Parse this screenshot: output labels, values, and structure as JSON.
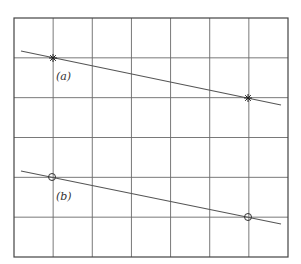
{
  "figure": {
    "grid": {
      "x0": 14,
      "y0": 18,
      "x1": 288,
      "y1": 257,
      "cols": 7,
      "rows": 6
    },
    "lines": [
      {
        "id": "a",
        "label": "(a)",
        "label_pos": [
          56,
          80
        ],
        "start": [
          21,
          51
        ],
        "end": [
          281,
          105
        ],
        "marker": "star",
        "points": [
          [
            53,
            58
          ],
          [
            248,
            98
          ]
        ]
      },
      {
        "id": "b",
        "label": "(b)",
        "label_pos": [
          56,
          200
        ],
        "start": [
          21,
          171
        ],
        "end": [
          281,
          224
        ],
        "marker": "circle",
        "points": [
          [
            52,
            177
          ],
          [
            248,
            217
          ]
        ]
      }
    ],
    "colors": {
      "grid": "#6a6a6a",
      "line": "#555555",
      "background": "#ffffff"
    }
  }
}
